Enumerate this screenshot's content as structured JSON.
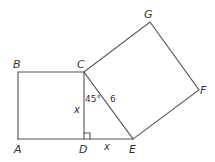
{
  "diagram": {
    "points": {
      "A": [
        18,
        139
      ],
      "B": [
        18,
        72
      ],
      "C": [
        84,
        72
      ],
      "D": [
        84,
        139
      ],
      "E": [
        133,
        139
      ],
      "F": [
        199,
        90
      ],
      "G": [
        150,
        22
      ]
    },
    "labels": {
      "A": "A",
      "B": "B",
      "C": "C",
      "D": "D",
      "E": "E",
      "F": "F",
      "G": "G",
      "side_CD": "x",
      "side_DE": "x",
      "hypotenuse_CE": "6",
      "angle_DCE": "45°"
    },
    "shapes": [
      {
        "type": "square",
        "vertices": [
          "A",
          "B",
          "C",
          "D"
        ]
      },
      {
        "type": "right-triangle",
        "vertices": [
          "C",
          "D",
          "E"
        ],
        "right_angle_at": "D"
      },
      {
        "type": "square",
        "vertices": [
          "C",
          "E",
          "F",
          "G"
        ]
      }
    ],
    "colors": {
      "stroke": "#555555",
      "text": "#333333",
      "background": "#ffffff"
    }
  }
}
